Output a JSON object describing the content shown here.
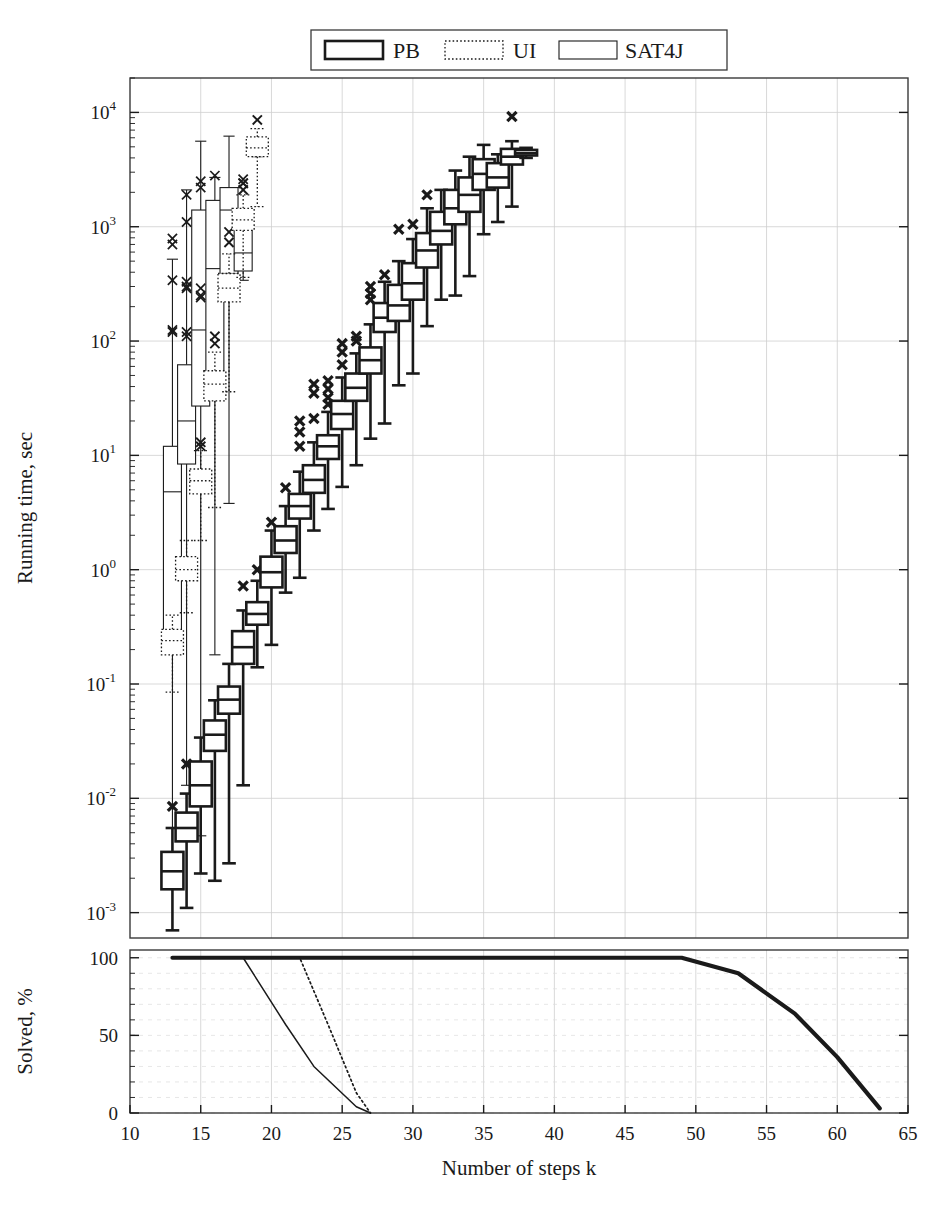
{
  "chart_data": {
    "type": "box",
    "title": "",
    "xlabel": "Number of steps k",
    "panels": [
      {
        "name": "runtime",
        "ylabel": "Running time, sec",
        "yscale": "log",
        "ylim": [
          0.0006,
          20000
        ],
        "yticks": [
          0.001,
          0.01,
          0.1,
          1,
          10,
          100,
          1000,
          10000
        ],
        "yticklabels": [
          "10^-3",
          "10^-2",
          "10^-1",
          "10^0",
          "10^1",
          "10^2",
          "10^3",
          "10^4"
        ],
        "grid": true
      },
      {
        "name": "solved",
        "ylabel": "Solved, %",
        "yscale": "linear",
        "ylim": [
          0,
          105
        ],
        "yticks": [
          0,
          50,
          100
        ],
        "yticklabels": [
          "0",
          "50",
          "100"
        ],
        "grid": true
      }
    ],
    "xlim": [
      10,
      65
    ],
    "xticks": [
      10,
      15,
      20,
      25,
      30,
      35,
      40,
      45,
      50,
      55,
      60,
      65
    ],
    "xticklabels": [
      "10",
      "15",
      "20",
      "25",
      "30",
      "35",
      "40",
      "45",
      "50",
      "55",
      "60",
      "65"
    ],
    "legend": {
      "position": "top-center-outside",
      "entries": [
        {
          "label": "PB",
          "style": "solid-bold"
        },
        {
          "label": "UI",
          "style": "dotted"
        },
        {
          "label": "SAT4J",
          "style": "solid-thin"
        }
      ]
    },
    "series": [
      {
        "name": "PB",
        "style": "solid-bold",
        "boxes": [
          {
            "k": 13,
            "whisker_low": 0.0007,
            "q1": 0.0016,
            "median": 0.0023,
            "q3": 0.0034,
            "whisker_high": 0.0055,
            "outliers": [
              0.0085
            ]
          },
          {
            "k": 14,
            "whisker_low": 0.0011,
            "q1": 0.0042,
            "median": 0.0055,
            "q3": 0.0075,
            "whisker_high": 0.011,
            "outliers": [
              0.02
            ]
          },
          {
            "k": 15,
            "whisker_low": 0.0022,
            "q1": 0.0085,
            "median": 0.013,
            "q3": 0.021,
            "whisker_high": 0.034,
            "outliers": []
          },
          {
            "k": 16,
            "whisker_low": 0.0019,
            "q1": 0.026,
            "median": 0.036,
            "q3": 0.048,
            "whisker_high": 0.072,
            "outliers": []
          },
          {
            "k": 17,
            "whisker_low": 0.0027,
            "q1": 0.055,
            "median": 0.073,
            "q3": 0.095,
            "whisker_high": 0.15,
            "outliers": []
          },
          {
            "k": 18,
            "whisker_low": 0.013,
            "q1": 0.15,
            "median": 0.21,
            "q3": 0.29,
            "whisker_high": 0.44,
            "outliers": [
              0.72
            ]
          },
          {
            "k": 19,
            "whisker_low": 0.14,
            "q1": 0.33,
            "median": 0.41,
            "q3": 0.52,
            "whisker_high": 0.8,
            "outliers": [
              1.0
            ]
          },
          {
            "k": 20,
            "whisker_low": 0.22,
            "q1": 0.7,
            "median": 0.95,
            "q3": 1.3,
            "whisker_high": 2.2,
            "outliers": [
              2.6
            ]
          },
          {
            "k": 21,
            "whisker_low": 0.63,
            "q1": 1.4,
            "median": 1.8,
            "q3": 2.4,
            "whisker_high": 3.6,
            "outliers": [
              5.2
            ]
          },
          {
            "k": 22,
            "whisker_low": 0.85,
            "q1": 2.8,
            "median": 3.6,
            "q3": 4.6,
            "whisker_high": 7.2,
            "outliers": [
              12,
              16,
              20
            ]
          },
          {
            "k": 23,
            "whisker_low": 2.2,
            "q1": 4.7,
            "median": 6.1,
            "q3": 8.2,
            "whisker_high": 13,
            "outliers": [
              21,
              35,
              42
            ]
          },
          {
            "k": 24,
            "whisker_low": 3.4,
            "q1": 9.3,
            "median": 12,
            "q3": 15,
            "whisker_high": 24,
            "outliers": [
              28,
              32,
              38,
              45
            ]
          },
          {
            "k": 25,
            "whisker_low": 5.3,
            "q1": 17,
            "median": 23,
            "q3": 30,
            "whisker_high": 48,
            "outliers": [
              62,
              80,
              95
            ]
          },
          {
            "k": 26,
            "whisker_low": 8.2,
            "q1": 30,
            "median": 39,
            "q3": 52,
            "whisker_high": 78,
            "outliers": [
              100,
              110
            ]
          },
          {
            "k": 27,
            "whisker_low": 14,
            "q1": 52,
            "median": 68,
            "q3": 88,
            "whisker_high": 140,
            "outliers": [
              230,
              260,
              300
            ]
          },
          {
            "k": 28,
            "whisker_low": 19,
            "q1": 120,
            "median": 160,
            "q3": 215,
            "whisker_high": 330,
            "outliers": [
              380
            ]
          },
          {
            "k": 29,
            "whisker_low": 41,
            "q1": 150,
            "median": 205,
            "q3": 310,
            "whisker_high": 500,
            "outliers": [
              950
            ]
          },
          {
            "k": 30,
            "whisker_low": 52,
            "q1": 230,
            "median": 320,
            "q3": 480,
            "whisker_high": 780,
            "outliers": [
              1050
            ]
          },
          {
            "k": 31,
            "whisker_low": 135,
            "q1": 440,
            "median": 620,
            "q3": 880,
            "whisker_high": 1450,
            "outliers": [
              1900
            ]
          },
          {
            "k": 32,
            "whisker_low": 230,
            "q1": 700,
            "median": 920,
            "q3": 1350,
            "whisker_high": 2100,
            "outliers": []
          },
          {
            "k": 33,
            "whisker_low": 250,
            "q1": 1050,
            "median": 1450,
            "q3": 2100,
            "whisker_high": 3100,
            "outliers": []
          },
          {
            "k": 34,
            "whisker_low": 370,
            "q1": 1350,
            "median": 1900,
            "q3": 2700,
            "whisker_high": 4100,
            "outliers": []
          },
          {
            "k": 35,
            "whisker_low": 860,
            "q1": 2100,
            "median": 2900,
            "q3": 3900,
            "whisker_high": 5200,
            "outliers": []
          },
          {
            "k": 36,
            "whisker_low": 1100,
            "q1": 2200,
            "median": 2700,
            "q3": 3600,
            "whisker_high": 4300,
            "outliers": []
          },
          {
            "k": 37,
            "whisker_low": 1500,
            "q1": 3500,
            "median": 4100,
            "q3": 4800,
            "whisker_high": 5600,
            "outliers": [
              9200
            ]
          },
          {
            "k": 38,
            "whisker_low": 4000,
            "q1": 4200,
            "median": 4400,
            "q3": 4700,
            "whisker_high": 4900,
            "outliers": []
          }
        ]
      },
      {
        "name": "UI",
        "style": "dotted",
        "boxes": [
          {
            "k": 13,
            "whisker_low": 0.085,
            "q1": 0.18,
            "median": 0.24,
            "q3": 0.3,
            "whisker_high": 0.4,
            "outliers": []
          },
          {
            "k": 14,
            "whisker_low": 0.42,
            "q1": 0.8,
            "median": 1.0,
            "q3": 1.3,
            "whisker_high": 1.8,
            "outliers": []
          },
          {
            "k": 15,
            "whisker_low": 1.8,
            "q1": 4.6,
            "median": 6.0,
            "q3": 7.6,
            "whisker_high": 11,
            "outliers": [
              12,
              13
            ]
          },
          {
            "k": 16,
            "whisker_low": 3.5,
            "q1": 30,
            "median": 42,
            "q3": 55,
            "whisker_high": 80,
            "outliers": [
              95,
              110
            ]
          },
          {
            "k": 17,
            "whisker_low": 36,
            "q1": 220,
            "median": 290,
            "q3": 390,
            "whisker_high": 580,
            "outliers": [
              730,
              900
            ]
          },
          {
            "k": 18,
            "whisker_low": 360,
            "q1": 930,
            "median": 1150,
            "q3": 1450,
            "whisker_high": 1900,
            "outliers": [
              2100,
              2400
            ]
          },
          {
            "k": 19,
            "whisker_low": 1500,
            "q1": 4100,
            "median": 4900,
            "q3": 6100,
            "whisker_high": 7200,
            "outliers": [
              8600
            ]
          }
        ]
      },
      {
        "name": "SAT4J",
        "style": "solid-thin",
        "boxes": [
          {
            "k": 13,
            "whisker_low": 0.0022,
            "q1": 0.23,
            "median": 4.8,
            "q3": 12,
            "whisker_high": 520,
            "outliers": [
              120,
              125,
              340,
              700,
              790
            ]
          },
          {
            "k": 14,
            "whisker_low": 0.013,
            "q1": 8.4,
            "median": 20,
            "q3": 62,
            "whisker_high": 2100,
            "outliers": [
              110,
              120,
              290,
              300,
              330,
              1100,
              1900
            ]
          },
          {
            "k": 15,
            "whisker_low": 0.0047,
            "q1": 27,
            "median": 125,
            "q3": 1400,
            "whisker_high": 5600,
            "outliers": [
              240,
              250,
              290,
              2200,
              2500
            ]
          },
          {
            "k": 16,
            "whisker_low": 0.18,
            "q1": 48,
            "median": 430,
            "q3": 1700,
            "whisker_high": 2700,
            "outliers": [
              2800
            ]
          },
          {
            "k": 17,
            "whisker_low": 3.8,
            "q1": 390,
            "median": 1400,
            "q3": 2200,
            "whisker_high": 6200,
            "outliers": []
          },
          {
            "k": 18,
            "whisker_low": 340,
            "q1": 410,
            "median": 590,
            "q3": 1000,
            "whisker_high": 1200,
            "outliers": [
              2400,
              2600
            ]
          },
          {
            "k": 19,
            "whisker_low": 4100,
            "q1": 4200,
            "median": 4400,
            "q3": 4700,
            "whisker_high": 4800,
            "outliers": []
          }
        ]
      }
    ],
    "solved_curves": [
      {
        "name": "PB",
        "style": "solid-bold",
        "x": [
          13,
          25,
          49,
          53,
          57,
          60,
          63
        ],
        "y": [
          100,
          100,
          100,
          90,
          64,
          36,
          3
        ]
      },
      {
        "name": "UI",
        "style": "dotted",
        "x": [
          13,
          22,
          24,
          26,
          27
        ],
        "y": [
          100,
          100,
          57,
          13,
          0
        ]
      },
      {
        "name": "SAT4J",
        "style": "solid-thin",
        "x": [
          13,
          18,
          21,
          23,
          26,
          27
        ],
        "y": [
          100,
          100,
          57,
          30,
          4,
          0
        ]
      }
    ]
  },
  "legend_labels": {
    "pb": "PB",
    "ui": "UI",
    "sat4j": "SAT4J"
  },
  "axes_text": {
    "top_ylabel": "Running time, sec",
    "bottom_ylabel": "Solved, %",
    "xlabel": "Number of steps k"
  }
}
